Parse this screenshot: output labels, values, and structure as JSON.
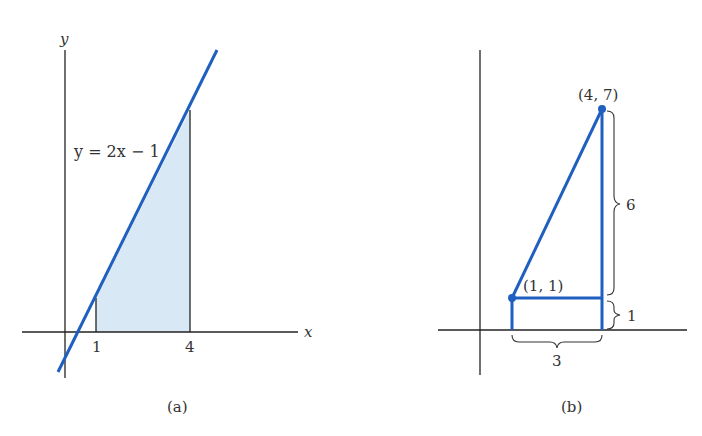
{
  "colors": {
    "curve": "#1f5fbf",
    "shade": "#d8e8f5",
    "axis": "#222222",
    "text": "#333333"
  },
  "panel_a": {
    "y_axis_label": "y",
    "x_axis_label": "x",
    "equation": "y = 2x − 1",
    "tick_1": "1",
    "tick_4": "4",
    "caption": "(a)"
  },
  "panel_b": {
    "point_top": "(4, 7)",
    "point_bottom": "(1, 1)",
    "brace_vertical_label": "6",
    "brace_small_label": "1",
    "brace_horizontal_label": "3",
    "caption": "(b)"
  }
}
